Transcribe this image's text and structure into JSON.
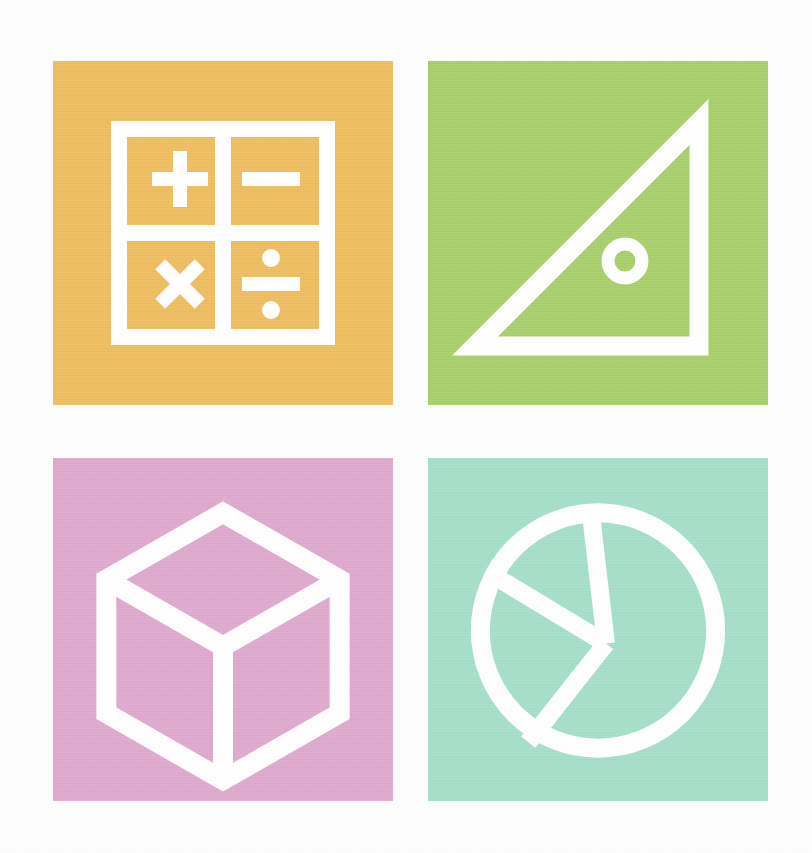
{
  "canvas": {
    "width": 812,
    "height": 853,
    "background_color": "#fdfdfd",
    "description": "Four flat-color square tiles arranged in a 2x2 grid, each containing a white line-art mathematics icon."
  },
  "grid": {
    "columns": 2,
    "rows": 2,
    "tile_width": 340,
    "tile_height": 344,
    "column_gap": 35,
    "row_gap": 53,
    "origin_x": 53,
    "origin_y": 61
  },
  "icon_color": "#ffffff",
  "tiles": [
    {
      "position": "top-left",
      "icon_name": "arithmetic-operations-icon",
      "label": "Arithmetic Operations",
      "background_color": "#f0bc58",
      "symbols": [
        "+",
        "−",
        "×",
        "÷"
      ],
      "symbol_names": [
        "plus-symbol",
        "minus-symbol",
        "multiply-symbol",
        "divide-symbol"
      ],
      "shape": "bordered square divided into four quadrants"
    },
    {
      "position": "top-right",
      "icon_name": "set-square-triangle-icon",
      "label": "Geometry Set Square",
      "background_color": "#a5cf66",
      "symbols": [
        "◢"
      ],
      "symbol_names": [
        "right-triangle-outline",
        "circular-hole-ring"
      ],
      "shape": "right triangle outline with right angle at bottom-right and a ring cut-out"
    },
    {
      "position": "bottom-left",
      "icon_name": "isometric-cube-icon",
      "label": "Solid Geometry Cube",
      "background_color": "#dfa7ce",
      "symbols": [
        "□"
      ],
      "symbol_names": [
        "cube-outline",
        "cube-inner-edges"
      ],
      "shape": "hexagonal isometric cube wireframe with three inner edges meeting at center"
    },
    {
      "position": "bottom-right",
      "icon_name": "pie-chart-icon",
      "label": "Pie Chart Statistics",
      "background_color": "#a2dfc9",
      "symbols": [
        "◕"
      ],
      "symbol_names": [
        "circle-outline",
        "pie-segment-divider"
      ],
      "shape": "circle outline divided into three pie segments",
      "segments": 3
    }
  ]
}
